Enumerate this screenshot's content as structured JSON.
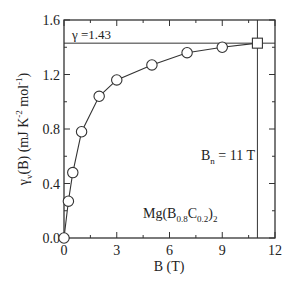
{
  "chart_data": {
    "type": "scatter",
    "title": "",
    "xlabel": "B (T)",
    "ylabel": "γ_v(B)  (mJ K^-2 mol^-1)",
    "xlim": [
      0,
      12
    ],
    "ylim": [
      0.0,
      1.6
    ],
    "xticks": [
      "0",
      "3",
      "6",
      "9",
      "12"
    ],
    "yticks": [
      "0.0",
      "0.4",
      "0.8",
      "1.2",
      "1.6"
    ],
    "grid": false,
    "series": [
      {
        "name": "Mg(B0.8C0.2)2",
        "marker": "circle-open",
        "x": [
          0,
          0.25,
          0.5,
          1,
          2,
          3,
          5,
          7,
          9
        ],
        "y": [
          0.0,
          0.27,
          0.48,
          0.78,
          1.04,
          1.16,
          1.27,
          1.36,
          1.4
        ]
      },
      {
        "name": "Bn point",
        "marker": "square-open",
        "x": [
          11
        ],
        "y": [
          1.43
        ]
      }
    ],
    "annotations": {
      "gamma_line": "γ =1.43",
      "gamma_value": 1.43,
      "bn_label": "B",
      "bn_sub": "n",
      "bn_value": " = 11 T",
      "bn_line_x": 11,
      "compound_prefix": "Mg(B",
      "compound_sub1": "0.8",
      "compound_mid": "C",
      "compound_sub2": "0.2",
      "compound_close": ")",
      "compound_sub3": "2"
    }
  },
  "labels": {
    "ylabel_main": "γ",
    "ylabel_sub": "v",
    "ylabel_rest": "(B)  (mJ K",
    "ylabel_sup1": "-2",
    "ylabel_mol": " mol",
    "ylabel_sup2": "-1",
    "ylabel_end": ")"
  }
}
